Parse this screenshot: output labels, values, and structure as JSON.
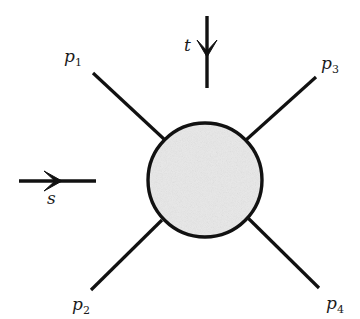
{
  "diagram": {
    "type": "scattering-vertex",
    "blob": {
      "cx": 205,
      "cy": 180,
      "r": 57,
      "fill": "#e6e6e6",
      "stroke": "#111111"
    },
    "legs": [
      {
        "id": "p1",
        "name": "p",
        "index": "1",
        "x1": 93,
        "y1": 73,
        "x2": 165,
        "y2": 140
      },
      {
        "id": "p2",
        "name": "p",
        "index": "2",
        "x1": 91,
        "y1": 290,
        "x2": 162,
        "y2": 220
      },
      {
        "id": "p3",
        "name": "p",
        "index": "3",
        "x1": 316,
        "y1": 77,
        "x2": 246,
        "y2": 140
      },
      {
        "id": "p4",
        "name": "p",
        "index": "4",
        "x1": 319,
        "y1": 288,
        "x2": 248,
        "y2": 218
      }
    ],
    "channels": {
      "t": {
        "label": "t",
        "direction": "down"
      },
      "s": {
        "label": "s",
        "direction": "right"
      }
    }
  }
}
